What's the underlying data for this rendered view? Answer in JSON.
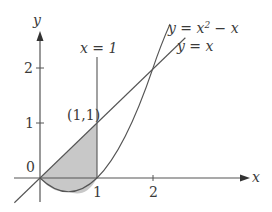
{
  "figure": {
    "type": "region-between-curves",
    "axes": {
      "x_label": "x",
      "y_label": "y",
      "x_ticks": [
        "1",
        "2"
      ],
      "y_ticks": [
        "1",
        "2"
      ],
      "origin_label": "0"
    },
    "curves": {
      "parabola_label_prefix": "y = x",
      "parabola_exp": "2",
      "parabola_label_suffix": " − x",
      "line_label": "y = x",
      "vertical_label": "x = 1"
    },
    "point_label": "(1,1)",
    "shaded_region": "area between y = x and y = x² − x for 0 ≤ x ≤ 1",
    "colors": {
      "stroke": "#555555",
      "shade": "#c8c8c8",
      "text": "#3a3a3a"
    }
  }
}
